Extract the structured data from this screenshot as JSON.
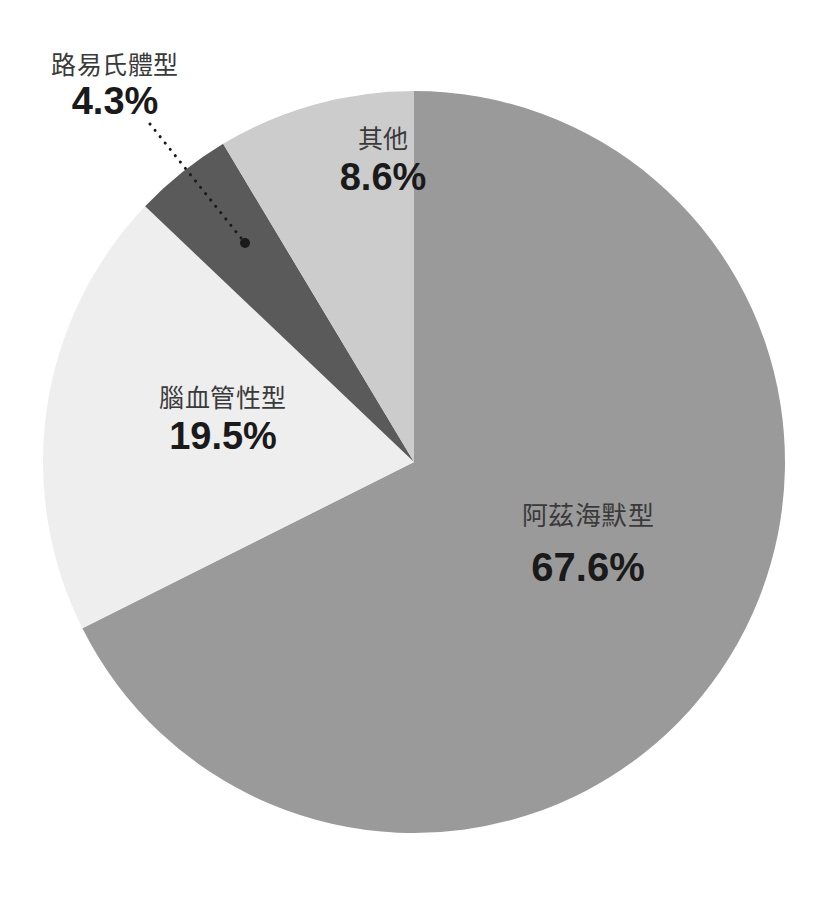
{
  "page": {
    "background_color": "#ffffff",
    "width": 828,
    "height": 898
  },
  "chart_data": {
    "type": "pie",
    "title": "",
    "subtitle": "",
    "xlabel": "",
    "ylabel": "",
    "legend_position": "none",
    "grid": false,
    "units": "percent",
    "start_angle_deg": 0,
    "direction": "clockwise",
    "total": 100.0,
    "categories": [
      "阿茲海默型",
      "腦血管性型",
      "路易氏體型",
      "其他"
    ],
    "values": [
      67.6,
      19.5,
      4.3,
      8.6
    ],
    "labels": [
      "67.6%",
      "19.5%",
      "4.3%",
      "8.6%"
    ],
    "colors": [
      "#9a9a9a",
      "#eeeeee",
      "#5a5a5a",
      "#cccccc"
    ],
    "slices": [
      {
        "name": "阿茲海默型",
        "value": 67.6,
        "value_label": "67.6%",
        "color": "#9a9a9a",
        "start_deg": 0.0,
        "end_deg": 243.36,
        "label_placement": "inside",
        "leader_line": false
      },
      {
        "name": "腦血管性型",
        "value": 19.5,
        "value_label": "19.5%",
        "color": "#eeeeee",
        "start_deg": 243.36,
        "end_deg": 313.56,
        "label_placement": "inside",
        "leader_line": false
      },
      {
        "name": "路易氏體型",
        "value": 4.3,
        "value_label": "4.3%",
        "color": "#5a5a5a",
        "start_deg": 313.56,
        "end_deg": 329.04,
        "label_placement": "outside",
        "leader_line": true
      },
      {
        "name": "其他",
        "value": 8.6,
        "value_label": "8.6%",
        "color": "#cccccc",
        "start_deg": 329.04,
        "end_deg": 360.0,
        "label_placement": "inside",
        "leader_line": false
      }
    ],
    "geometry": {
      "center_x": 414,
      "center_y": 462,
      "radius": 371
    },
    "leader": {
      "dot_x": 245,
      "dot_y": 243,
      "dot_radius": 5,
      "dot_color": "#1a1a1a",
      "line_color": "#1a1a1a",
      "line_style": "dotted",
      "line_width": 3,
      "from_x": 150,
      "from_y": 124
    }
  }
}
